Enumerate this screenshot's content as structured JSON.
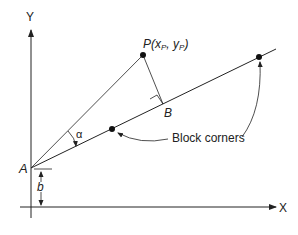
{
  "diagram": {
    "axes": {
      "x_label": "X",
      "y_label": "Y"
    },
    "points": {
      "origin_label": "A",
      "point_label": "P",
      "point_coords_open": "(",
      "point_x": "x",
      "point_x_sub": "P",
      "point_sep": ", ",
      "point_y": "y",
      "point_y_sub": "P",
      "point_coords_close": ")",
      "foot_label": "B"
    },
    "angle_label": "α",
    "offset_label": "b",
    "annotation": "Block corners",
    "colors": {
      "line": "#222222",
      "background": "#ffffff"
    }
  }
}
